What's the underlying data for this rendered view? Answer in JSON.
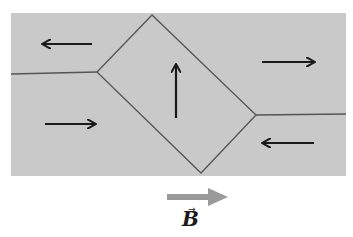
{
  "diagram": {
    "colors": {
      "background": "#ffffff",
      "material": "#c9c9c9",
      "boundary": "#555555",
      "arrow": "#1a1a1a",
      "field_arrow": "#9a9a9a"
    },
    "domains": [
      {
        "name": "upper-left-domain",
        "direction": "left"
      },
      {
        "name": "lower-left-domain",
        "direction": "right"
      },
      {
        "name": "center-diamond-domain",
        "direction": "up"
      },
      {
        "name": "upper-right-domain",
        "direction": "right"
      },
      {
        "name": "lower-right-domain",
        "direction": "left"
      }
    ],
    "field": {
      "label": "B",
      "vector_symbol": "→",
      "direction": "right"
    }
  }
}
